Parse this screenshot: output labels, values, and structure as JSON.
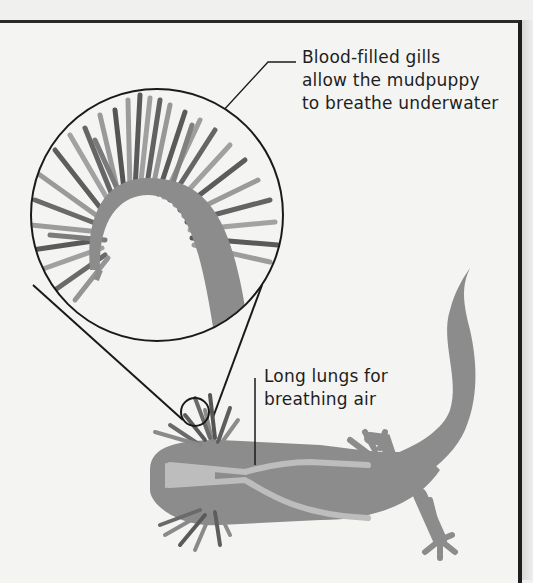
{
  "diagram": {
    "colors": {
      "body": "#8c8c8c",
      "gill_dark": "#5a5a5a",
      "gill_light": "#9a9a9a",
      "lungs": "#bdbdbd",
      "line": "#1a1a1a",
      "background": "#f4f4f2"
    },
    "annotations": [
      {
        "id": "gills",
        "lines": [
          "Blood-filled gills",
          "allow the mudpuppy",
          "to breathe underwater"
        ]
      },
      {
        "id": "lungs",
        "lines": [
          "Long lungs for",
          "breathing air"
        ]
      }
    ],
    "magnifier": {
      "target": "gills",
      "shape": "circle"
    }
  }
}
